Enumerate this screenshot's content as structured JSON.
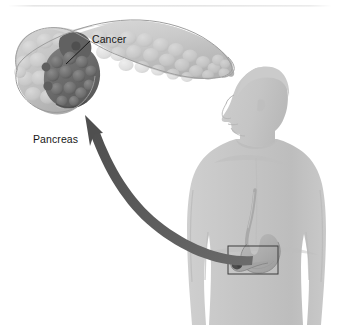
{
  "figure": {
    "background_color": "#ffffff",
    "width": 340,
    "height": 325,
    "top_rule": {
      "name": "top-divider-rule",
      "color": "#e3e3e3",
      "y": 6
    }
  },
  "labels": {
    "cancer": "Cancer",
    "pancreas": "Pancreas"
  },
  "leader_lines": {
    "cancer_leader": {
      "from_x": 90,
      "from_y": 41,
      "to_x": 66,
      "to_y": 63,
      "color": "#1a1a1a"
    }
  },
  "callout_arrow": {
    "name": "magnification-arrow",
    "description": "Thick curved arrow from abdomen inset up-left to enlarged pancreas",
    "color": "#565656",
    "tip_x": 85,
    "tip_y": 117,
    "tail_x": 250,
    "tail_y": 262
  },
  "inset_box": {
    "name": "abdomen-detail-box",
    "x": 228,
    "y": 246,
    "width": 50,
    "height": 28,
    "stroke_color": "#3d3d3d",
    "stroke_width": 1
  },
  "organs": {
    "pancreas_enlarged": {
      "name": "pancreas-enlarged",
      "body_color": "#c9c9c9",
      "head_color": "#b4b4b4",
      "outline_color": "#9a9a9a",
      "lobule_light": "#d6d6d6",
      "lobule_shadow": "#a8a8a8"
    },
    "tumor": {
      "name": "cancer-tumor-mass",
      "color": "#6e6e6e",
      "dark_color": "#555555",
      "lobule_color": "#7d7d7d"
    },
    "stomach": {
      "name": "stomach",
      "fill_color": "#b0b0b0",
      "outline_color": "#7c7c7c"
    },
    "esophagus": {
      "name": "esophagus",
      "fill_color": "#b3b3b3"
    },
    "pancreas_small": {
      "name": "pancreas-in-body",
      "fill_color": "#a5a5a5"
    },
    "tumor_small": {
      "name": "tumor-in-body",
      "fill_color": "#4a4a4a"
    }
  },
  "body_figure": {
    "name": "male-torso-silhouette",
    "skin_color": "#c4c4c4",
    "skin_shadow": "#b6b6b6",
    "hair_color": "#c8c8c8",
    "outline_color": "#b0b0b0",
    "facing": "left"
  }
}
